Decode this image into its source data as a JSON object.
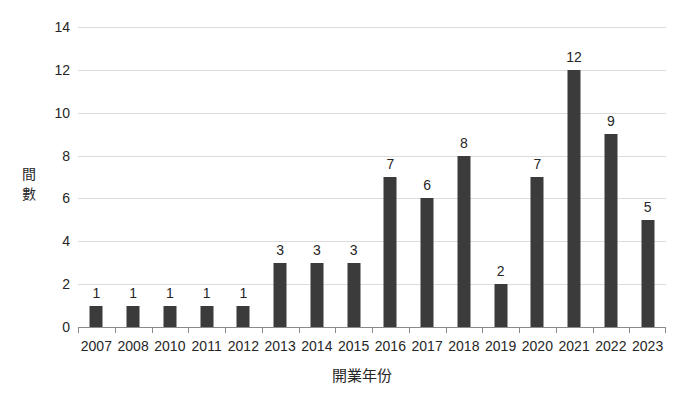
{
  "chart_data": {
    "type": "bar",
    "title": "",
    "subtitle": "",
    "xlabel": "開業年份",
    "ylabel": "間數",
    "categories": [
      "2007",
      "2008",
      "2010",
      "2011",
      "2012",
      "2013",
      "2014",
      "2015",
      "2016",
      "2017",
      "2018",
      "2019",
      "2020",
      "2021",
      "2022",
      "2023"
    ],
    "values": [
      1,
      1,
      1,
      1,
      1,
      3,
      3,
      3,
      7,
      6,
      8,
      2,
      7,
      12,
      9,
      5
    ],
    "data_labels": [
      "1",
      "1",
      "1",
      "1",
      "1",
      "3",
      "3",
      "3",
      "7",
      "6",
      "8",
      "2",
      "7",
      "12",
      "9",
      "5"
    ],
    "ylim": [
      0,
      14
    ],
    "ytick_values": [
      0,
      2,
      4,
      6,
      8,
      10,
      12,
      14
    ],
    "ytick_labels": [
      "0",
      "2",
      "4",
      "6",
      "8",
      "10",
      "12",
      "14"
    ],
    "grid": true,
    "grid_axis": "y",
    "legend": false,
    "legend_position": "none",
    "bar_color": "#3b3b3b",
    "gridline_color": "#dcdcdc",
    "axis_color": "#8a8a8a",
    "text_color": "#262626",
    "background_color": "#ffffff",
    "ylabel_chars": [
      "間",
      "數"
    ]
  }
}
